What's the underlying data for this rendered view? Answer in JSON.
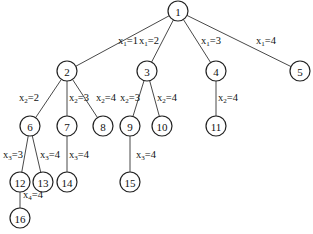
{
  "diagram": {
    "type": "tree",
    "nodes": [
      {
        "id": "1",
        "label": "1",
        "x": 178,
        "y": 11
      },
      {
        "id": "2",
        "label": "2",
        "x": 67,
        "y": 71
      },
      {
        "id": "3",
        "label": "3",
        "x": 147,
        "y": 71
      },
      {
        "id": "4",
        "label": "4",
        "x": 216,
        "y": 71
      },
      {
        "id": "5",
        "label": "5",
        "x": 300,
        "y": 71
      },
      {
        "id": "6",
        "label": "6",
        "x": 30,
        "y": 126
      },
      {
        "id": "7",
        "label": "7",
        "x": 67,
        "y": 126
      },
      {
        "id": "8",
        "label": "8",
        "x": 103,
        "y": 126
      },
      {
        "id": "9",
        "label": "9",
        "x": 130,
        "y": 126
      },
      {
        "id": "10",
        "label": "10",
        "x": 162,
        "y": 126
      },
      {
        "id": "11",
        "label": "11",
        "x": 216,
        "y": 126
      },
      {
        "id": "12",
        "label": "12",
        "x": 20,
        "y": 182
      },
      {
        "id": "13",
        "label": "13",
        "x": 43,
        "y": 182
      },
      {
        "id": "14",
        "label": "14",
        "x": 67,
        "y": 182
      },
      {
        "id": "15",
        "label": "15",
        "x": 130,
        "y": 182
      },
      {
        "id": "16",
        "label": "16",
        "x": 20,
        "y": 218
      }
    ],
    "edges": [
      {
        "from": "1",
        "to": "2",
        "var": "x",
        "sub": "1",
        "value": "1",
        "lx": 118,
        "ly": 44
      },
      {
        "from": "1",
        "to": "3",
        "var": "x",
        "sub": "1",
        "value": "2",
        "lx": 139,
        "ly": 44
      },
      {
        "from": "1",
        "to": "4",
        "var": "x",
        "sub": "1",
        "value": "3",
        "lx": 201,
        "ly": 44
      },
      {
        "from": "1",
        "to": "5",
        "var": "x",
        "sub": "1",
        "value": "4",
        "lx": 256,
        "ly": 44
      },
      {
        "from": "2",
        "to": "6",
        "var": "x",
        "sub": "2",
        "value": "2",
        "lx": 19,
        "ly": 101
      },
      {
        "from": "2",
        "to": "7",
        "var": "x",
        "sub": "2",
        "value": "3",
        "lx": 69,
        "ly": 101
      },
      {
        "from": "2",
        "to": "8",
        "var": "x",
        "sub": "2",
        "value": "4",
        "lx": 96,
        "ly": 101
      },
      {
        "from": "3",
        "to": "9",
        "var": "x",
        "sub": "2",
        "value": "3",
        "lx": 120,
        "ly": 101
      },
      {
        "from": "3",
        "to": "10",
        "var": "x",
        "sub": "2",
        "value": "4",
        "lx": 157,
        "ly": 101
      },
      {
        "from": "4",
        "to": "11",
        "var": "x",
        "sub": "2",
        "value": "4",
        "lx": 218,
        "ly": 101
      },
      {
        "from": "6",
        "to": "12",
        "var": "x",
        "sub": "3",
        "value": "3",
        "lx": 3,
        "ly": 158
      },
      {
        "from": "6",
        "to": "13",
        "var": "x",
        "sub": "3",
        "value": "4",
        "lx": 40,
        "ly": 158
      },
      {
        "from": "7",
        "to": "14",
        "var": "x",
        "sub": "3",
        "value": "4",
        "lx": 69,
        "ly": 158
      },
      {
        "from": "9",
        "to": "15",
        "var": "x",
        "sub": "3",
        "value": "4",
        "lx": 136,
        "ly": 158
      },
      {
        "from": "12",
        "to": "16",
        "var": "x",
        "sub": "4",
        "value": "4",
        "lx": 23,
        "ly": 198
      }
    ],
    "node_radius": 10,
    "colors": {
      "stroke": "#222222",
      "fill": "#ffffff",
      "text": "#111111",
      "background": "#ffffff"
    }
  }
}
